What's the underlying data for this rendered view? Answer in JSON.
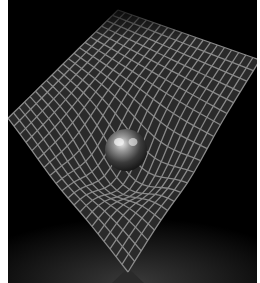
{
  "image": {
    "subject": "spacetime-curvature-grid",
    "description": "A massive sphere resting in a warped square grid on a black background",
    "colors": {
      "background": "#000000",
      "margin": "#ffffff",
      "grid_line": "#8a8a8a",
      "grid_cell": "#2a2a2a",
      "sphere_highlight": "#e0e0e0",
      "sphere_body": "#3a3a3a",
      "floor_glow": "#2e2e2e"
    },
    "grid": {
      "divisions": 20,
      "corners": {
        "left": [
          0,
          118
        ],
        "top": [
          110,
          10
        ],
        "right": [
          252,
          60
        ],
        "bottom": [
          120,
          272
        ]
      },
      "well_center": [
        118,
        150
      ],
      "well_depth": 34,
      "well_radius": 55
    },
    "sphere": {
      "cx": 118,
      "cy": 150,
      "r": 21
    }
  }
}
